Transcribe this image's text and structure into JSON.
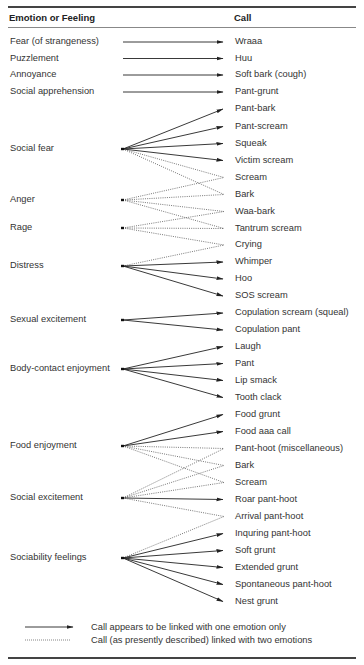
{
  "header": {
    "emotion_col": "Emotion or Feeling",
    "call_col": "Call"
  },
  "emotions": [
    {
      "id": "fear",
      "label": "Fear (of strangeness)",
      "y": 42
    },
    {
      "id": "puzzlement",
      "label": "Puzzlement",
      "y": 58.5
    },
    {
      "id": "annoyance",
      "label": "Annoyance",
      "y": 75
    },
    {
      "id": "social_apprehension",
      "label": "Social apprehension",
      "y": 92
    },
    {
      "id": "social_fear",
      "label": "Social fear",
      "y": 149
    },
    {
      "id": "anger",
      "label": "Anger",
      "y": 200
    },
    {
      "id": "rage",
      "label": "Rage",
      "y": 228
    },
    {
      "id": "distress",
      "label": "Distress",
      "y": 266
    },
    {
      "id": "sexual_excitement",
      "label": "Sexual excitement",
      "y": 320
    },
    {
      "id": "body_contact_enjoyment",
      "label": "Body-contact enjoyment",
      "y": 369
    },
    {
      "id": "food_enjoyment",
      "label": "Food enjoyment",
      "y": 446
    },
    {
      "id": "social_excitement",
      "label": "Social excitement",
      "y": 498
    },
    {
      "id": "sociability_feelings",
      "label": "Sociability feelings",
      "y": 558
    }
  ],
  "calls": [
    {
      "id": "wraaa",
      "label": "Wraaa",
      "y": 42
    },
    {
      "id": "huu",
      "label": "Huu",
      "y": 58.5
    },
    {
      "id": "soft_bark",
      "label": "Soft bark (cough)",
      "y": 75
    },
    {
      "id": "pant_grunt",
      "label": "Pant-grunt",
      "y": 92
    },
    {
      "id": "pant_bark",
      "label": "Pant-bark",
      "y": 109
    },
    {
      "id": "pant_scream",
      "label": "Pant-scream",
      "y": 126.5
    },
    {
      "id": "squeak",
      "label": "Squeak",
      "y": 143.5
    },
    {
      "id": "victim_scream",
      "label": "Victim scream",
      "y": 160.5
    },
    {
      "id": "scream1",
      "label": "Scream",
      "y": 177.5
    },
    {
      "id": "bark1",
      "label": "Bark",
      "y": 194.5
    },
    {
      "id": "waa_bark",
      "label": "Waa-bark",
      "y": 211.5
    },
    {
      "id": "tantrum_scream",
      "label": "Tantrum scream",
      "y": 228.5
    },
    {
      "id": "crying",
      "label": "Crying",
      "y": 245
    },
    {
      "id": "whimper",
      "label": "Whimper",
      "y": 262
    },
    {
      "id": "hoo",
      "label": "Hoo",
      "y": 279
    },
    {
      "id": "sos_scream",
      "label": "SOS scream",
      "y": 296
    },
    {
      "id": "copulation_scream",
      "label": "Copulation scream (squeal)",
      "y": 313
    },
    {
      "id": "copulation_pant",
      "label": "Copulation pant",
      "y": 330
    },
    {
      "id": "laugh",
      "label": "Laugh",
      "y": 346.5
    },
    {
      "id": "pant",
      "label": "Pant",
      "y": 363.5
    },
    {
      "id": "lip_smack",
      "label": "Lip smack",
      "y": 380.5
    },
    {
      "id": "tooth_clack",
      "label": "Tooth clack",
      "y": 397.5
    },
    {
      "id": "food_grunt",
      "label": "Food grunt",
      "y": 414.5
    },
    {
      "id": "food_aaa_call",
      "label": "Food aaa call",
      "y": 431.5
    },
    {
      "id": "pant_hoot_misc",
      "label": "Pant-hoot (miscellaneous)",
      "y": 448.5
    },
    {
      "id": "bark2",
      "label": "Bark",
      "y": 465.5
    },
    {
      "id": "scream2",
      "label": "Scream",
      "y": 482.5
    },
    {
      "id": "roar_pant_hoot",
      "label": "Roar pant-hoot",
      "y": 499.5
    },
    {
      "id": "arrival_pant_hoot",
      "label": "Arrival pant-hoot",
      "y": 516.5
    },
    {
      "id": "inquring_pant_hoot",
      "label": "Inquring pant-hoot",
      "y": 533.5
    },
    {
      "id": "soft_grunt",
      "label": "Soft grunt",
      "y": 550.5
    },
    {
      "id": "extended_grunt",
      "label": "Extended grunt",
      "y": 567.5
    },
    {
      "id": "spontaneous_pant_hoot",
      "label": "Spontaneous pant-hoot",
      "y": 584.5
    },
    {
      "id": "nest_grunt",
      "label": "Nest grunt",
      "y": 601.5
    }
  ],
  "links": [
    {
      "from": "fear",
      "to": "wraaa",
      "style": "solid"
    },
    {
      "from": "puzzlement",
      "to": "huu",
      "style": "solid"
    },
    {
      "from": "annoyance",
      "to": "soft_bark",
      "style": "solid"
    },
    {
      "from": "social_apprehension",
      "to": "pant_grunt",
      "style": "solid"
    },
    {
      "from": "social_fear",
      "to": "pant_bark",
      "style": "solid"
    },
    {
      "from": "social_fear",
      "to": "pant_scream",
      "style": "solid"
    },
    {
      "from": "social_fear",
      "to": "squeak",
      "style": "solid"
    },
    {
      "from": "social_fear",
      "to": "victim_scream",
      "style": "solid"
    },
    {
      "from": "social_fear",
      "to": "scream1",
      "style": "dotted"
    },
    {
      "from": "social_fear",
      "to": "bark1",
      "style": "dotted"
    },
    {
      "from": "anger",
      "to": "scream1",
      "style": "dotted"
    },
    {
      "from": "anger",
      "to": "bark1",
      "style": "dotted"
    },
    {
      "from": "anger",
      "to": "waa_bark",
      "style": "dotted"
    },
    {
      "from": "anger",
      "to": "tantrum_scream",
      "style": "dotted"
    },
    {
      "from": "rage",
      "to": "waa_bark",
      "style": "dotted"
    },
    {
      "from": "rage",
      "to": "tantrum_scream",
      "style": "dotted"
    },
    {
      "from": "rage",
      "to": "crying",
      "style": "dotted"
    },
    {
      "from": "distress",
      "to": "crying",
      "style": "dotted"
    },
    {
      "from": "distress",
      "to": "whimper",
      "style": "solid"
    },
    {
      "from": "distress",
      "to": "hoo",
      "style": "solid"
    },
    {
      "from": "distress",
      "to": "sos_scream",
      "style": "solid"
    },
    {
      "from": "sexual_excitement",
      "to": "copulation_scream",
      "style": "solid"
    },
    {
      "from": "sexual_excitement",
      "to": "copulation_pant",
      "style": "solid"
    },
    {
      "from": "body_contact_enjoyment",
      "to": "laugh",
      "style": "solid"
    },
    {
      "from": "body_contact_enjoyment",
      "to": "pant",
      "style": "solid"
    },
    {
      "from": "body_contact_enjoyment",
      "to": "lip_smack",
      "style": "solid"
    },
    {
      "from": "body_contact_enjoyment",
      "to": "tooth_clack",
      "style": "solid"
    },
    {
      "from": "food_enjoyment",
      "to": "food_grunt",
      "style": "solid"
    },
    {
      "from": "food_enjoyment",
      "to": "food_aaa_call",
      "style": "solid"
    },
    {
      "from": "food_enjoyment",
      "to": "pant_hoot_misc",
      "style": "dotted"
    },
    {
      "from": "food_enjoyment",
      "to": "bark2",
      "style": "dotted"
    },
    {
      "from": "food_enjoyment",
      "to": "scream2",
      "style": "dotted"
    },
    {
      "from": "social_excitement",
      "to": "pant_hoot_misc",
      "style": "dotted"
    },
    {
      "from": "social_excitement",
      "to": "bark2",
      "style": "dotted"
    },
    {
      "from": "social_excitement",
      "to": "scream2",
      "style": "dotted"
    },
    {
      "from": "social_excitement",
      "to": "roar_pant_hoot",
      "style": "solid"
    },
    {
      "from": "social_excitement",
      "to": "arrival_pant_hoot",
      "style": "dotted"
    },
    {
      "from": "sociability_feelings",
      "to": "arrival_pant_hoot",
      "style": "dotted"
    },
    {
      "from": "sociability_feelings",
      "to": "inquring_pant_hoot",
      "style": "solid"
    },
    {
      "from": "sociability_feelings",
      "to": "soft_grunt",
      "style": "solid"
    },
    {
      "from": "sociability_feelings",
      "to": "extended_grunt",
      "style": "solid"
    },
    {
      "from": "sociability_feelings",
      "to": "spontaneous_pant_hoot",
      "style": "solid"
    },
    {
      "from": "sociability_feelings",
      "to": "nest_grunt",
      "style": "solid"
    }
  ],
  "legend": {
    "solid": "Call appears to be linked with one emotion only",
    "dotted": "Call (as presently described) linked with two emotions"
  },
  "colors": {
    "line": "#222222",
    "dotted": "#555555",
    "text": "#333333"
  }
}
